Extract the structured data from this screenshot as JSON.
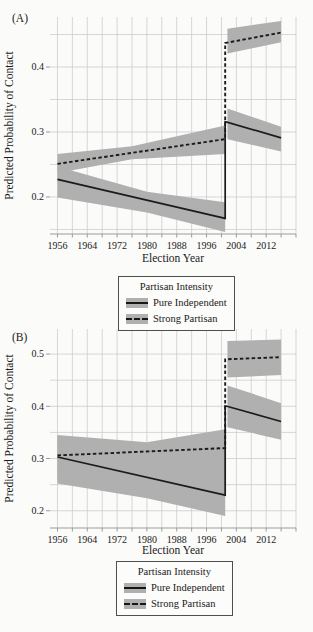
{
  "legend": {
    "title": "Partisan Intensity",
    "entries": [
      {
        "label": "Pure Independent",
        "line_style": "solid"
      },
      {
        "label": "Strong Partisan",
        "line_style": "dashed"
      }
    ],
    "band_color": "#b0b0b0",
    "line_color": "#1b1b1b"
  },
  "chart_data": [
    {
      "type": "line",
      "panel": "A",
      "panel_label": "(A)",
      "xlabel": "Election Year",
      "ylabel": "Predicted Probability of Contact",
      "xlim": [
        1954,
        2020
      ],
      "ylim": [
        0.143,
        0.477
      ],
      "grid": true,
      "legend_position": "below",
      "jump_year": 2001,
      "band_color": "#b0b0b0",
      "x_gridlines": [
        1956,
        1960,
        1964,
        1968,
        1972,
        1976,
        1980,
        1984,
        1988,
        1992,
        1996,
        2000,
        2004,
        2008,
        2012,
        2016,
        2020
      ],
      "x_ticks_labeled": [
        1956,
        1964,
        1972,
        1980,
        1988,
        1996,
        2004,
        2012
      ],
      "y_gridlines": [
        0.15,
        0.2,
        0.25,
        0.3,
        0.35,
        0.4,
        0.45
      ],
      "y_ticks_labeled": [
        0.2,
        0.3,
        0.4
      ],
      "series": [
        {
          "name": "Pure Independent",
          "line_style": "solid",
          "line": [
            [
              1956,
              0.227
            ],
            [
              2001,
              0.167
            ],
            [
              2001,
              0.316
            ],
            [
              2016,
              0.291
            ]
          ],
          "bands": [
            {
              "x": [
                1956,
                1980,
                2001
              ],
              "hi": [
                0.247,
                0.208,
                0.192
              ],
              "lo": [
                0.199,
                0.176,
                0.146
              ]
            },
            {
              "x": [
                2001.6,
                2016
              ],
              "hi": [
                0.336,
                0.308
              ],
              "lo": [
                0.289,
                0.27
              ]
            }
          ]
        },
        {
          "name": "Strong Partisan",
          "line_style": "dashed",
          "line": [
            [
              1956,
              0.251
            ],
            [
              2001,
              0.289
            ],
            [
              2001,
              0.437
            ],
            [
              2016,
              0.453
            ]
          ],
          "bands": [
            {
              "x": [
                1956,
                1976,
                2001
              ],
              "hi": [
                0.266,
                0.278,
                0.31
              ],
              "lo": [
                0.237,
                0.258,
                0.266
              ]
            },
            {
              "x": [
                2001.6,
                2016
              ],
              "hi": [
                0.459,
                0.471
              ],
              "lo": [
                0.421,
                0.438
              ]
            }
          ]
        }
      ]
    },
    {
      "type": "line",
      "panel": "B",
      "panel_label": "(B)",
      "xlabel": "Election Year",
      "ylabel": "Predicted Probability of Contact",
      "xlim": [
        1954,
        2020
      ],
      "ylim": [
        0.167,
        0.548
      ],
      "grid": true,
      "legend_position": "below",
      "jump_year": 2001,
      "band_color": "#b0b0b0",
      "x_gridlines": [
        1956,
        1960,
        1964,
        1968,
        1972,
        1976,
        1980,
        1984,
        1988,
        1992,
        1996,
        2000,
        2004,
        2008,
        2012,
        2016,
        2020
      ],
      "x_ticks_labeled": [
        1956,
        1964,
        1972,
        1980,
        1988,
        1996,
        2004,
        2012
      ],
      "y_gridlines": [
        0.2,
        0.25,
        0.3,
        0.35,
        0.4,
        0.45,
        0.5
      ],
      "y_ticks_labeled": [
        0.2,
        0.3,
        0.4,
        0.5
      ],
      "series": [
        {
          "name": "Pure Independent",
          "line_style": "solid",
          "line": [
            [
              1956,
              0.303
            ],
            [
              2001,
              0.23
            ],
            [
              2001,
              0.401
            ],
            [
              2016,
              0.371
            ]
          ],
          "bands": [
            {
              "x": [
                1956,
                1980,
                2001
              ],
              "hi": [
                0.342,
                0.296,
                0.272
              ],
              "lo": [
                0.252,
                0.224,
                0.19
              ]
            },
            {
              "x": [
                2001.6,
                2016
              ],
              "hi": [
                0.44,
                0.406
              ],
              "lo": [
                0.36,
                0.336
              ]
            }
          ]
        },
        {
          "name": "Strong Partisan",
          "line_style": "dashed",
          "line": [
            [
              1956,
              0.306
            ],
            [
              2001,
              0.32
            ],
            [
              2001,
              0.49
            ],
            [
              2016,
              0.494
            ]
          ],
          "bands": [
            {
              "x": [
                1956,
                1980,
                2001
              ],
              "hi": [
                0.345,
                0.331,
                0.356
              ],
              "lo": [
                0.26,
                0.284,
                0.271
              ]
            },
            {
              "x": [
                2001.6,
                2016
              ],
              "hi": [
                0.525,
                0.528
              ],
              "lo": [
                0.455,
                0.46
              ]
            }
          ]
        }
      ]
    }
  ]
}
